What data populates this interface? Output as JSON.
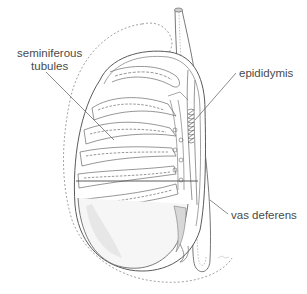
{
  "diagram": {
    "type": "anatomical-illustration",
    "labels": [
      {
        "id": "seminiferous-tubules",
        "line1": "seminiferous",
        "line2": "tubules"
      },
      {
        "id": "epididymis",
        "text": "epididymis"
      },
      {
        "id": "vas-deferens",
        "text": "vas deferens"
      }
    ],
    "colors": {
      "line": "#5a5a5a",
      "light_line": "#9a9a9a",
      "label": "#4a4a4a",
      "background": "#ffffff"
    }
  }
}
